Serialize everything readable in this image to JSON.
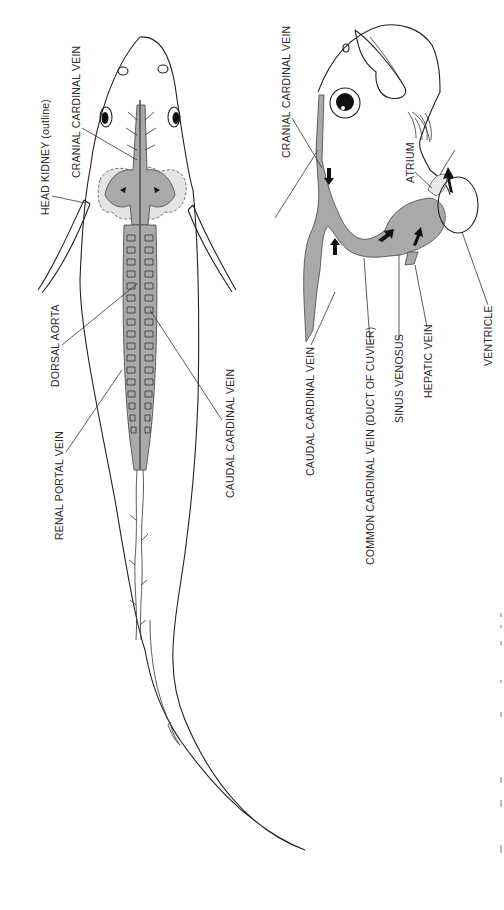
{
  "figure": {
    "type": "anatomical-diagram",
    "colors": {
      "vein_fill": "#a9a9a9",
      "kidney_fill": "#e4e4e4",
      "ink": "#222222"
    },
    "left_panel": {
      "description": "Ventral view of fish showing cardinal venous system",
      "labels": {
        "cranial_cardinal_vein": "CRANIAL CARDINAL VEIN",
        "head_kidney": "HEAD KIDNEY (outline)",
        "dorsal_aorta": "DORSAL AORTA",
        "renal_portal_vein": "RENAL PORTAL VEIN",
        "caudal_cardinal_vein": "CAUDAL CARDINAL VEIN"
      }
    },
    "right_panel": {
      "description": "Lateral view of fish head showing venous return to heart",
      "labels": {
        "cranial_cardinal_vein": "CRANIAL CARDINAL VEIN",
        "atrium": "ATRIUM",
        "caudal_cardinal_vein": "CAUDAL CARDINAL VEIN",
        "common_cardinal_vein": "COMMON CARDINAL VEIN (DUCT OF CUVIER)",
        "sinus_venosus": "SINUS VENOSUS",
        "hepatic_vein": "HEPATIC VEIN",
        "ventricle": "VENTRICLE"
      }
    }
  }
}
